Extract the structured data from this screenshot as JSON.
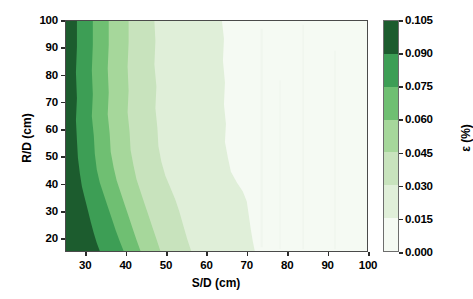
{
  "chart_data": {
    "type": "heatmap",
    "title": "",
    "xlabel": "S/D (cm)",
    "ylabel": "R/D (cm)",
    "colorbar_label": "ε (%)",
    "xlim": [
      25,
      100
    ],
    "ylim": [
      15,
      100
    ],
    "xticks": [
      30,
      40,
      50,
      60,
      70,
      80,
      90,
      100
    ],
    "yticks": [
      20,
      30,
      40,
      50,
      60,
      70,
      80,
      90,
      100
    ],
    "grid": false,
    "legend_position": "right",
    "colorbar": {
      "min": 0.0,
      "max": 0.105,
      "step": 0.015,
      "ticks": [
        "0.000",
        "0.015",
        "0.030",
        "0.045",
        "0.060",
        "0.075",
        "0.090",
        "0.105"
      ],
      "levels": [
        0.0,
        0.015,
        0.03,
        0.045,
        0.06,
        0.075,
        0.09,
        0.105
      ],
      "band_colors": [
        "#f4f9f2",
        "#e2efdd",
        "#ccе5c3",
        "#addfa0",
        "#74c476",
        "#41a65a",
        "#1f6b35"
      ],
      "colors_low_to_high": [
        "#f5faf3",
        "#e0efd9",
        "#c8e3bd",
        "#a6d79b",
        "#6fbf72",
        "#3d9e55",
        "#1c5c2e"
      ]
    },
    "contour_bands": [
      {
        "level_range": [
          0.09,
          0.105
        ],
        "color": "#1c5c2e",
        "left_x": 25,
        "right_edge_x_by_y": [
          [
            100,
            27.5
          ],
          [
            60,
            27.8
          ],
          [
            30,
            29.5
          ],
          [
            15,
            32.0
          ]
        ]
      },
      {
        "level_range": [
          0.075,
          0.09
        ],
        "color": "#3d9e55",
        "right_edge_x_by_y": [
          [
            100,
            31.5
          ],
          [
            60,
            32.0
          ],
          [
            30,
            34.5
          ],
          [
            15,
            38.0
          ]
        ]
      },
      {
        "level_range": [
          0.06,
          0.075
        ],
        "color": "#6fbf72",
        "right_edge_x_by_y": [
          [
            100,
            35.5
          ],
          [
            60,
            36.5
          ],
          [
            30,
            40.0
          ],
          [
            15,
            44.0
          ]
        ]
      },
      {
        "level_range": [
          0.045,
          0.06
        ],
        "color": "#a6d79b",
        "right_edge_x_by_y": [
          [
            100,
            40.5
          ],
          [
            60,
            42.0
          ],
          [
            30,
            46.0
          ],
          [
            15,
            50.0
          ]
        ]
      },
      {
        "level_range": [
          0.03,
          0.045
        ],
        "color": "#c8e3bd",
        "right_edge_x_by_y": [
          [
            100,
            47.0
          ],
          [
            60,
            49.0
          ],
          [
            30,
            53.0
          ],
          [
            15,
            57.0
          ]
        ]
      },
      {
        "level_range": [
          0.015,
          0.03
        ],
        "color": "#e0efd9",
        "right_edge_x_by_y": [
          [
            100,
            64.0
          ],
          [
            60,
            65.0
          ],
          [
            40,
            66.5
          ],
          [
            30,
            70.0
          ],
          [
            15,
            72.0
          ]
        ]
      },
      {
        "level_range": [
          0.0,
          0.015
        ],
        "color": "#f5faf3",
        "right_edge_x_by_y": [
          [
            100,
            100
          ],
          [
            15,
            100
          ]
        ]
      }
    ]
  }
}
